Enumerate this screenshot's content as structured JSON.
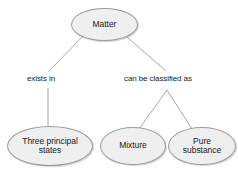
{
  "diagram": {
    "type": "concept-map",
    "background_color": "#ffffff",
    "node_fill_color": "#efefef",
    "node_border_color": "#9a9a9a",
    "edge_color": "#a0a0a0",
    "text_color": "#1a1a1a",
    "nodes": [
      {
        "id": "matter",
        "label": "Matter"
      },
      {
        "id": "three",
        "label": "Three principal\nstates"
      },
      {
        "id": "mixture",
        "label": "Mixture"
      },
      {
        "id": "pure",
        "label": "Pure\nsubstance"
      }
    ],
    "edges": [
      {
        "from": "matter",
        "to": "three",
        "label": "exists in"
      },
      {
        "from": "matter",
        "to": "mixture",
        "label": "can be classified as"
      },
      {
        "from": "matter",
        "to": "pure",
        "label": "can be classified as"
      }
    ],
    "edge_labels": {
      "left": "exists in",
      "right": "can be classified as"
    }
  }
}
